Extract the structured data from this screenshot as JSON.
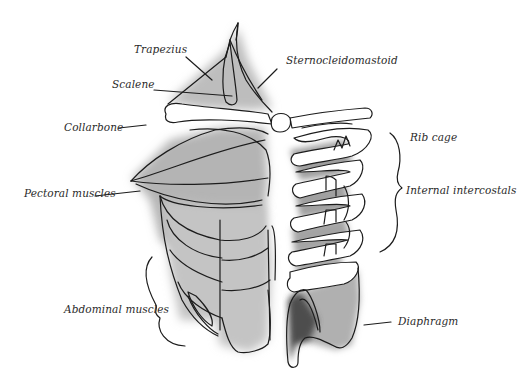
{
  "diagram": {
    "colors": {
      "line": "#1c1c1c",
      "shade_light": "#d9d9d9",
      "shade_mid": "#a8a8a8",
      "shade_dark": "#5a5a5a",
      "text": "#2a2a2a",
      "background": "#ffffff"
    },
    "labels": {
      "trapezius": "Trapezius",
      "scalene": "Scalene",
      "sternocleidomastoid": "Sternocleidomastoid",
      "collarbone": "Collarbone",
      "rib_cage": "Rib cage",
      "pectoral_muscles": "Pectoral muscles",
      "internal_intercostals": "Internal intercostals",
      "abdominal_muscles": "Abdominal muscles",
      "diaphragm": "Diaphragm"
    }
  }
}
